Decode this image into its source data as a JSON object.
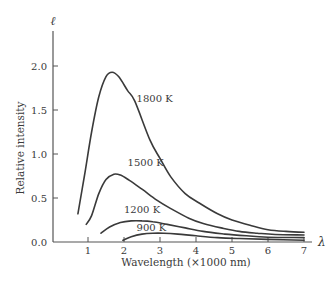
{
  "chart_data": {
    "type": "line",
    "title": "",
    "xlabel": "Wavelength (×1000 nm)",
    "ylabel": "Relative intensity",
    "x_axis_symbol": "λ",
    "y_axis_symbol": "ℓ",
    "xlim": [
      0,
      7
    ],
    "ylim": [
      0,
      2.2
    ],
    "x_ticks": [
      1,
      2,
      3,
      4,
      5,
      6,
      7
    ],
    "y_ticks": [
      0.0,
      0.5,
      1.0,
      1.5,
      2.0
    ],
    "y_tick_labels": [
      "0.0",
      "0.5",
      "1.0",
      "1.5",
      "2.0"
    ],
    "grid": false,
    "legend": "inline labels",
    "colors": {
      "line": "#3a3a3a",
      "axis": "#555555",
      "background": "#ffffff"
    },
    "series": [
      {
        "name": "1800 K",
        "label_pos": {
          "x": 2.35,
          "y": 1.59
        },
        "x": [
          0.72,
          0.9,
          1.1,
          1.3,
          1.5,
          1.67,
          1.85,
          2.1,
          2.3,
          2.72,
          3.0,
          3.3,
          3.7,
          4.1,
          4.6,
          5.0,
          5.5,
          6.0,
          6.5,
          7.0
        ],
        "y": [
          0.32,
          0.75,
          1.25,
          1.65,
          1.88,
          1.93,
          1.88,
          1.72,
          1.6,
          1.16,
          0.95,
          0.74,
          0.55,
          0.44,
          0.32,
          0.25,
          0.19,
          0.14,
          0.12,
          0.11
        ]
      },
      {
        "name": "1500 K",
        "label_pos": {
          "x": 2.1,
          "y": 0.86
        },
        "x": [
          0.95,
          1.1,
          1.3,
          1.5,
          1.72,
          1.9,
          2.15,
          2.5,
          2.9,
          3.3,
          3.8,
          4.2,
          4.7,
          5.2,
          5.7,
          6.2,
          7.0
        ],
        "y": [
          0.2,
          0.3,
          0.55,
          0.71,
          0.77,
          0.76,
          0.7,
          0.6,
          0.48,
          0.38,
          0.27,
          0.21,
          0.16,
          0.12,
          0.1,
          0.085,
          0.08
        ]
      },
      {
        "name": "1200 K",
        "label_pos": {
          "x": 2.0,
          "y": 0.33
        },
        "x": [
          1.36,
          1.6,
          1.9,
          2.2,
          2.5,
          2.8,
          3.2,
          3.7,
          4.2,
          4.8,
          5.4,
          6.0,
          7.0
        ],
        "y": [
          0.1,
          0.17,
          0.22,
          0.24,
          0.24,
          0.23,
          0.2,
          0.16,
          0.12,
          0.09,
          0.07,
          0.055,
          0.05
        ]
      },
      {
        "name": "900 K",
        "label_pos": {
          "x": 2.35,
          "y": 0.12
        },
        "x": [
          1.97,
          2.2,
          2.5,
          2.8,
          3.1,
          3.5,
          4.0,
          4.6,
          5.2,
          6.0,
          7.0
        ],
        "y": [
          0.02,
          0.06,
          0.09,
          0.1,
          0.1,
          0.09,
          0.07,
          0.05,
          0.04,
          0.03,
          0.02
        ]
      }
    ]
  }
}
